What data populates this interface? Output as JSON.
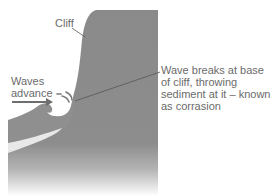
{
  "diagram": {
    "labels": {
      "cliff": "Cliff",
      "waves_line1": "Waves",
      "waves_line2": "advance",
      "desc_line1": "Wave breaks at base",
      "desc_line2": "of cliff, throwing",
      "desc_line3": "sediment at it – known",
      "desc_line4": "as corrasion"
    },
    "colors": {
      "cliff": "#8a8a8a",
      "wave": "#8f8f8f",
      "wave_highlight": "#e6e6e6",
      "arrow": "#7a7a7a",
      "text": "#6b6b6b",
      "leader_line": "#555555"
    }
  }
}
